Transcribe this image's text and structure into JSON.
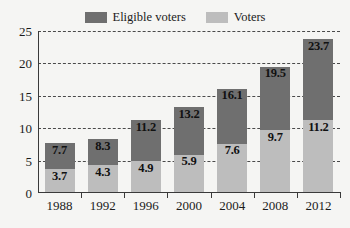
{
  "chart_data": {
    "type": "bar",
    "subtype": "stacked-bar",
    "title": "",
    "subtitle": "",
    "xlabel": "",
    "ylabel": "",
    "categories": [
      "1988",
      "1992",
      "1996",
      "2000",
      "2004",
      "2008",
      "2012"
    ],
    "series": [
      {
        "name": "Voters",
        "color": "#bdbdbd",
        "values": [
          3.7,
          4.3,
          4.9,
          5.9,
          7.6,
          9.7,
          11.2
        ],
        "labels": [
          "3.7",
          "4.3",
          "4.9",
          "5.9",
          "7.6",
          "9.7",
          "11.2"
        ]
      },
      {
        "name": "Eligible voters",
        "color": "#6f6f6f",
        "values": [
          7.7,
          8.3,
          11.2,
          13.2,
          16.1,
          19.5,
          23.7
        ],
        "labels": [
          "7.7",
          "8.3",
          "11.2",
          "13.2",
          "16.1",
          "19.5",
          "23.7"
        ]
      }
    ],
    "stacking_note": "Eligible voters segment is drawn above the Voters segment; its top equals the Eligible voters value.",
    "ylim": [
      0,
      25
    ],
    "yticks": [
      0,
      5,
      10,
      15,
      20,
      25
    ],
    "ytick_labels": [
      "0",
      "5",
      "10",
      "15",
      "20",
      "25"
    ],
    "grid": true,
    "grid_style": "dashed",
    "legend_position": "top-center",
    "background_color": "#f5f5f3",
    "axis_color": "#3a3a3a",
    "grid_color": "#4a4a4a",
    "label_text_color": "#111111"
  },
  "legend": {
    "entries": [
      {
        "label": "Eligible voters",
        "color": "#6f6f6f"
      },
      {
        "label": "Voters",
        "color": "#bdbdbd"
      }
    ]
  },
  "axes": {
    "y_ticks": [
      "25",
      "20",
      "15",
      "10",
      "5",
      "0"
    ],
    "x_ticks": [
      "1988",
      "1992",
      "1996",
      "2000",
      "2004",
      "2008",
      "2012"
    ]
  },
  "bars": [
    {
      "year": "1988",
      "upper_label": "7.7",
      "lower_label": "3.7"
    },
    {
      "year": "1992",
      "upper_label": "8.3",
      "lower_label": "4.3"
    },
    {
      "year": "1996",
      "upper_label": "11.2",
      "lower_label": "4.9"
    },
    {
      "year": "2000",
      "upper_label": "13.2",
      "lower_label": "5.9"
    },
    {
      "year": "2004",
      "upper_label": "16.1",
      "lower_label": "7.6"
    },
    {
      "year": "2008",
      "upper_label": "19.5",
      "lower_label": "9.7"
    },
    {
      "year": "2012",
      "upper_label": "23.7",
      "lower_label": "11.2"
    }
  ]
}
